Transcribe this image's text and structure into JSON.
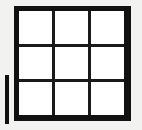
{
  "figure": {
    "type": "grid-diagram",
    "background_color": "#f2f2f0",
    "frame_color": "#111111",
    "cell_color": "#ffffff",
    "gridline_color": "#1a1a1a",
    "rows": 3,
    "columns": 3,
    "cell_count": 9,
    "cells": [
      {
        "id": "r1c1",
        "label": "",
        "row": 1,
        "column": 1
      },
      {
        "id": "r1c2",
        "label": "",
        "row": 1,
        "column": 2
      },
      {
        "id": "r1c3",
        "label": "",
        "row": 1,
        "column": 3
      },
      {
        "id": "r2c1",
        "label": "",
        "row": 2,
        "column": 1
      },
      {
        "id": "r2c2",
        "label": "",
        "row": 2,
        "column": 2
      },
      {
        "id": "r2c3",
        "label": "",
        "row": 2,
        "column": 3
      },
      {
        "id": "r3c1",
        "label": "",
        "row": 3,
        "column": 1
      },
      {
        "id": "r3c2",
        "label": "",
        "row": 3,
        "column": 2
      },
      {
        "id": "r3c3",
        "label": "",
        "row": 3,
        "column": 3
      }
    ],
    "side_marker": {
      "name": "vertical-bar",
      "label": "",
      "color": "#111111",
      "orientation": "vertical"
    }
  }
}
